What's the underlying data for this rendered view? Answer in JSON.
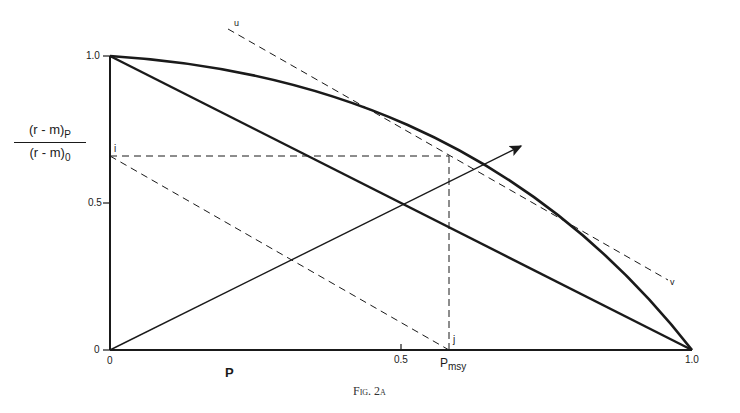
{
  "figure": {
    "caption": "Fig. 2a",
    "y_axis": {
      "label_numerator": "(r - m)",
      "label_numerator_sub": "P",
      "label_denominator": "(r - m)",
      "label_denominator_sub": "0",
      "ticks": [
        "1.0",
        "0.5",
        "0"
      ]
    },
    "x_axis": {
      "label": "P",
      "ticks": [
        "0",
        "0.5",
        "1.0"
      ],
      "special_tick": "P",
      "special_tick_sub": "msy"
    },
    "point_labels": {
      "i": "i",
      "j": "j",
      "u": "u",
      "v": "v"
    },
    "elements": [
      {
        "name": "curve",
        "description": "Concave curve from (0,1) to (1,0)"
      },
      {
        "name": "straight-line",
        "description": "Straight line from (0,1) to (1,0)"
      },
      {
        "name": "tangent-uv",
        "description": "Dashed tangent line u–v touching curve"
      },
      {
        "name": "dashed-i-j",
        "description": "Dashed line from i on y-axis to j on x-axis, parallel to u–v"
      },
      {
        "name": "horizontal-dashed",
        "description": "Horizontal dashed line at y≈0.66 from i to tangency point"
      },
      {
        "name": "vertical-dashed",
        "description": "Vertical dashed line from tangency point down to Pmsy"
      },
      {
        "name": "arrow",
        "description": "Arrow from origin through curve intersection"
      }
    ]
  },
  "colors": {
    "ink": "#1a1a1a",
    "background": "#ffffff"
  }
}
